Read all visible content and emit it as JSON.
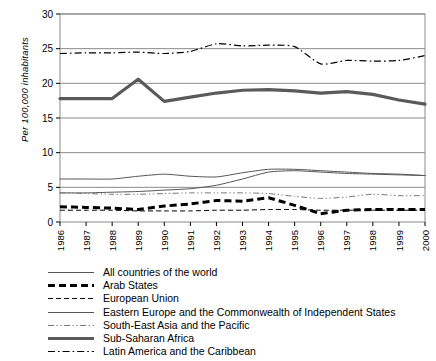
{
  "chart_data": {
    "type": "line",
    "title": "",
    "xlabel": "",
    "ylabel": "Per 100,000 inhabitants",
    "ylim": [
      0,
      30
    ],
    "yticks": [
      0,
      5,
      10,
      15,
      20,
      25,
      30
    ],
    "grid": true,
    "legend_position": "below",
    "categories": [
      "1986",
      "1987",
      "1988",
      "1989",
      "1990",
      "1991",
      "1992",
      "1993",
      "1994",
      "1995",
      "1996",
      "1997",
      "1998",
      "1999",
      "2000"
    ],
    "series": [
      {
        "name": "All countries of the world",
        "style": "solid-thin",
        "color": "#555555",
        "values": [
          4.2,
          4.2,
          4.3,
          4.4,
          4.6,
          4.8,
          5.3,
          6.2,
          7.2,
          7.4,
          7.2,
          7.0,
          6.9,
          6.8,
          6.7
        ]
      },
      {
        "name": "Arab States",
        "style": "dashed-thick",
        "color": "#000000",
        "values": [
          2.2,
          2.1,
          2.0,
          1.8,
          2.3,
          2.6,
          3.1,
          3.0,
          3.5,
          2.4,
          1.2,
          1.7,
          1.8,
          1.8,
          1.8
        ]
      },
      {
        "name": "European Union",
        "style": "dashed-thin",
        "color": "#000000",
        "values": [
          1.7,
          1.7,
          1.7,
          1.6,
          1.6,
          1.6,
          1.7,
          1.7,
          1.8,
          1.8,
          1.7,
          1.7,
          1.7,
          1.7,
          1.7
        ]
      },
      {
        "name": "Eastern Europe and the Commonwealth of Independent States",
        "style": "solid-thin",
        "color": "#555555",
        "values": [
          6.2,
          6.2,
          6.2,
          6.6,
          6.9,
          6.6,
          6.5,
          7.1,
          7.6,
          7.6,
          7.4,
          7.2,
          7.0,
          6.9,
          6.7
        ]
      },
      {
        "name": "South-East Asia and the Pacific",
        "style": "dashdotdot-thin",
        "color": "#777777",
        "values": [
          4.2,
          4.1,
          4.0,
          4.0,
          4.1,
          4.2,
          4.2,
          4.2,
          4.1,
          3.7,
          3.4,
          3.6,
          4.0,
          3.8,
          3.8
        ]
      },
      {
        "name": "Sub-Saharan Africa",
        "style": "solid-thick",
        "color": "#5a5a5a",
        "values": [
          17.8,
          17.8,
          17.8,
          20.6,
          17.4,
          18.0,
          18.6,
          19.0,
          19.1,
          18.9,
          18.6,
          18.8,
          18.4,
          17.6,
          17.0
        ]
      },
      {
        "name": "Latin America and the Caribbean",
        "style": "dashdot-thin",
        "color": "#000000",
        "values": [
          24.3,
          24.4,
          24.4,
          24.5,
          24.3,
          24.6,
          25.7,
          25.4,
          25.5,
          25.3,
          22.8,
          23.3,
          23.2,
          23.3,
          24.0
        ]
      }
    ]
  },
  "legend": {
    "items": [
      {
        "label": "All countries of the world",
        "sample": "solid-thin"
      },
      {
        "label": "Arab States",
        "sample": "dashed-thick"
      },
      {
        "label": "European Union",
        "sample": "dashed-thin"
      },
      {
        "label": "Eastern Europe and the Commonwealth of Independent States",
        "sample": "solid-thin"
      },
      {
        "label": "South-East Asia and the Pacific",
        "sample": "dashdotdot-thin"
      },
      {
        "label": "Sub-Saharan Africa",
        "sample": "solid-thick"
      },
      {
        "label": "Latin America and the Caribbean",
        "sample": "dashdot-thin"
      }
    ]
  }
}
